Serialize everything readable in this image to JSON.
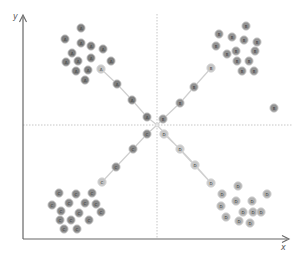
{
  "diagram": {
    "x_axis_label": "x",
    "y_axis_label": "y",
    "colors": {
      "axis": "#666666",
      "guide": "#b8b8b8",
      "connector": "#cfcfcf",
      "cluster_A": "#808080",
      "cluster_B": "#939393",
      "cluster_C": "#8a8a8a",
      "cluster_D": "#b3b3b3",
      "center": "#e6e6e6"
    },
    "center_point": {
      "label": "",
      "x": 157,
      "y": 125
    },
    "clusters": [
      {
        "name": "A",
        "label": "A",
        "color_key": "cluster_A",
        "points": [
          [
            81,
            28
          ],
          [
            65,
            39
          ],
          [
            81,
            43
          ],
          [
            91,
            46
          ],
          [
            103,
            49
          ],
          [
            72,
            53
          ],
          [
            66,
            62
          ],
          [
            78,
            61
          ],
          [
            91,
            58
          ],
          [
            111,
            61
          ],
          [
            76,
            71
          ],
          [
            88,
            70
          ],
          [
            85,
            80
          ]
        ],
        "path": [
          [
            101,
            69
          ],
          [
            117,
            84
          ],
          [
            132,
            100
          ],
          [
            147,
            117
          ]
        ]
      },
      {
        "name": "B",
        "label": "B",
        "color_key": "cluster_B",
        "points": [
          [
            246,
            26
          ],
          [
            219,
            34
          ],
          [
            232,
            37
          ],
          [
            244,
            40
          ],
          [
            257,
            42
          ],
          [
            216,
            46
          ],
          [
            227,
            54
          ],
          [
            236,
            51
          ],
          [
            255,
            51
          ],
          [
            237,
            61
          ],
          [
            249,
            61
          ],
          [
            242,
            71
          ],
          [
            254,
            71
          ],
          [
            274,
            108
          ]
        ],
        "path": [
          [
            211,
            68
          ],
          [
            194,
            87
          ],
          [
            180,
            103
          ],
          [
            163,
            119
          ]
        ]
      },
      {
        "name": "C",
        "label": "C",
        "color_key": "cluster_C",
        "points": [
          [
            59,
            193
          ],
          [
            76,
            194
          ],
          [
            92,
            193
          ],
          [
            52,
            205
          ],
          [
            69,
            203
          ],
          [
            61,
            211
          ],
          [
            85,
            203
          ],
          [
            96,
            204
          ],
          [
            79,
            213
          ],
          [
            101,
            212
          ],
          [
            60,
            220
          ],
          [
            71,
            220
          ],
          [
            89,
            220
          ],
          [
            64,
            229
          ],
          [
            77,
            229
          ]
        ],
        "path": [
          [
            102,
            182
          ],
          [
            116,
            167
          ],
          [
            133,
            149
          ],
          [
            147,
            134
          ]
        ]
      },
      {
        "name": "D",
        "label": "D",
        "color_key": "cluster_D",
        "points": [
          [
            238,
            186
          ],
          [
            222,
            194
          ],
          [
            267,
            194
          ],
          [
            221,
            206
          ],
          [
            236,
            201
          ],
          [
            252,
            201
          ],
          [
            243,
            212
          ],
          [
            253,
            212
          ],
          [
            261,
            212
          ],
          [
            226,
            217
          ],
          [
            239,
            221
          ],
          [
            250,
            223
          ]
        ],
        "path": [
          [
            164,
            134
          ],
          [
            180,
            149
          ],
          [
            195,
            165
          ],
          [
            211,
            183
          ]
        ]
      }
    ]
  }
}
